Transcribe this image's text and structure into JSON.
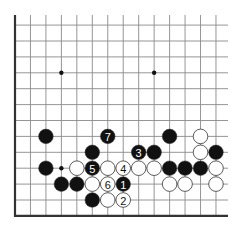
{
  "diagram": {
    "type": "go-board-fragment",
    "grid": {
      "columns": 14,
      "rows": 13,
      "origin_x": 15,
      "origin_y": 25.1,
      "spacing_x": 15.46,
      "spacing_y": 15.9,
      "left_edge": true,
      "bottom_edge": true,
      "top_open": true,
      "right_open": true
    },
    "colors": {
      "line": "#8a8a8a",
      "edge": "#333333",
      "black": "#111111",
      "white": "#ffffff",
      "stone_outline": "#333333"
    },
    "star_points": [
      {
        "col": 3,
        "row": 3
      },
      {
        "col": 9,
        "row": 3
      },
      {
        "col": 3,
        "row": 9
      }
    ],
    "stones": [
      {
        "col": 2,
        "row": 7,
        "color": "black",
        "label": ""
      },
      {
        "col": 6,
        "row": 7,
        "color": "black",
        "label": "7"
      },
      {
        "col": 10,
        "row": 7,
        "color": "black",
        "label": ""
      },
      {
        "col": 12,
        "row": 7,
        "color": "white",
        "label": ""
      },
      {
        "col": 5,
        "row": 8,
        "color": "black",
        "label": ""
      },
      {
        "col": 8,
        "row": 8,
        "color": "black",
        "label": "3"
      },
      {
        "col": 9,
        "row": 8,
        "color": "black",
        "label": ""
      },
      {
        "col": 12,
        "row": 8,
        "color": "white",
        "label": ""
      },
      {
        "col": 13,
        "row": 8,
        "color": "black",
        "label": ""
      },
      {
        "col": 2,
        "row": 9,
        "color": "black",
        "label": ""
      },
      {
        "col": 4,
        "row": 9,
        "color": "white",
        "label": ""
      },
      {
        "col": 5,
        "row": 9,
        "color": "black",
        "label": "5"
      },
      {
        "col": 6,
        "row": 9,
        "color": "white",
        "label": ""
      },
      {
        "col": 7,
        "row": 9,
        "color": "white",
        "label": "4"
      },
      {
        "col": 8,
        "row": 9,
        "color": "white",
        "label": ""
      },
      {
        "col": 9,
        "row": 9,
        "color": "white",
        "label": ""
      },
      {
        "col": 10,
        "row": 9,
        "color": "black",
        "label": ""
      },
      {
        "col": 11,
        "row": 9,
        "color": "black",
        "label": ""
      },
      {
        "col": 12,
        "row": 9,
        "color": "black",
        "label": ""
      },
      {
        "col": 13,
        "row": 9,
        "color": "white",
        "label": ""
      },
      {
        "col": 3,
        "row": 10,
        "color": "black",
        "label": ""
      },
      {
        "col": 4,
        "row": 10,
        "color": "black",
        "label": ""
      },
      {
        "col": 5,
        "row": 10,
        "color": "white",
        "label": ""
      },
      {
        "col": 6,
        "row": 10,
        "color": "white",
        "label": "6"
      },
      {
        "col": 7,
        "row": 10,
        "color": "black",
        "label": "1"
      },
      {
        "col": 10,
        "row": 10,
        "color": "white",
        "label": ""
      },
      {
        "col": 11,
        "row": 10,
        "color": "white",
        "label": ""
      },
      {
        "col": 13,
        "row": 10,
        "color": "white",
        "label": ""
      },
      {
        "col": 5,
        "row": 11,
        "color": "black",
        "label": ""
      },
      {
        "col": 6,
        "row": 11,
        "color": "white",
        "label": ""
      },
      {
        "col": 7,
        "row": 11,
        "color": "white",
        "label": "2"
      }
    ]
  }
}
